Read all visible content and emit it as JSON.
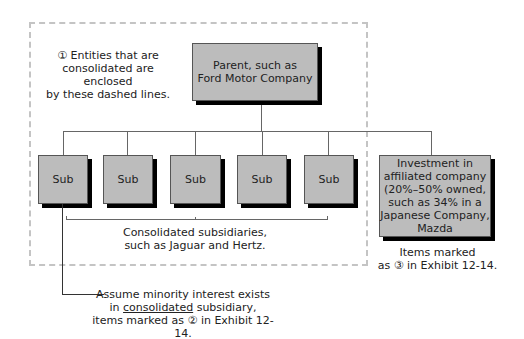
{
  "diagram": {
    "note_dashed": "① Entities that are consolidated are enclosed by these dashed lines.",
    "note_dashed_lines": [
      "① Entities that are",
      "consolidated are enclosed",
      "by these dashed lines."
    ],
    "parent": {
      "lines": [
        "Parent, such as",
        "Ford Motor Company"
      ]
    },
    "subs": [
      {
        "label": "Sub"
      },
      {
        "label": "Sub"
      },
      {
        "label": "Sub"
      },
      {
        "label": "Sub"
      },
      {
        "label": "Sub"
      }
    ],
    "subs_caption_lines": [
      "Consolidated subsidiaries,",
      "such as Jaguar and Hertz."
    ],
    "affiliate": {
      "lines": [
        "Investment in",
        "affiliated company",
        "(20%–50% owned,",
        "such as 34% in a",
        "Japanese Company,",
        "Mazda"
      ]
    },
    "affiliate_caption_lines": [
      "Items marked",
      "as ③ in Exhibit 12-14."
    ],
    "minority_note": {
      "line1": "Assume minority interest exists",
      "line2_pre": "in ",
      "line2_underlined": "consolidated",
      "line2_post": " subsidiary,",
      "line3": "items marked as ② in Exhibit 12-14."
    },
    "colors": {
      "box_fill": "#bcbcbc",
      "shadow": "#000000",
      "dashed": "#c4c4c4",
      "connector": "#666666"
    }
  }
}
